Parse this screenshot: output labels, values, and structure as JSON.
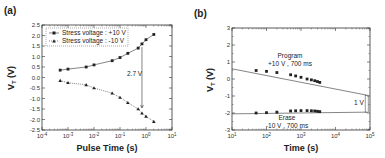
{
  "chart_data": [
    {
      "panel": "(a)",
      "type": "scatter",
      "title": "",
      "xlabel": "Pulse Time (s)",
      "ylabel": "V_T (V)",
      "xscale": "log",
      "xlim": [
        0.0001,
        10
      ],
      "ylim": [
        -2.5,
        2.5
      ],
      "xticks": [
        "10^-4",
        "10^-3",
        "10^-2",
        "10^-1",
        "10^0",
        "10^1"
      ],
      "yticks": [
        "2.5",
        "2.0",
        "1.5",
        "1.0",
        "0.5",
        "0.0",
        "-0.5",
        "-1.0",
        "-1.5",
        "-2.0",
        "-2.5"
      ],
      "grid": false,
      "legend_position": "upper left",
      "series": [
        {
          "name": "Stress voltage : +10 V",
          "marker": "square",
          "x": [
            0.0005,
            0.001,
            0.005,
            0.01,
            0.05,
            0.1,
            0.2,
            0.5,
            0.7,
            1.0,
            2.0
          ],
          "y": [
            0.35,
            0.4,
            0.5,
            0.6,
            0.8,
            0.95,
            1.15,
            1.4,
            1.6,
            1.8,
            2.05
          ]
        },
        {
          "name": "Stress voltage : -10 V",
          "marker": "triangle",
          "x": [
            0.0005,
            0.001,
            0.005,
            0.01,
            0.05,
            0.1,
            0.2,
            0.5,
            0.7,
            1.0,
            2.0
          ],
          "y": [
            -0.15,
            -0.25,
            -0.35,
            -0.5,
            -0.75,
            -0.95,
            -1.2,
            -1.5,
            -1.7,
            -1.85,
            -2.1
          ]
        }
      ],
      "annotations": [
        {
          "text": "2.7 V",
          "x": 0.7,
          "y_from": 1.45,
          "y_to": -1.45
        }
      ]
    },
    {
      "panel": "(b)",
      "type": "line",
      "title": "",
      "xlabel": "Time (s)",
      "ylabel": "V_T (V)",
      "xscale": "log",
      "xlim": [
        10,
        100000
      ],
      "ylim": [
        -3,
        3
      ],
      "xticks": [
        "10^1",
        "10^2",
        "10^3",
        "10^4",
        "10^5"
      ],
      "yticks": [
        "3",
        "2",
        "1",
        "0",
        "-1",
        "-2",
        "-3"
      ],
      "grid": false,
      "series": [
        {
          "name": "Program +10 V , 700 ms",
          "marker": "square",
          "x": [
            50,
            100,
            200,
            500,
            700,
            1000,
            1500,
            2000,
            2500,
            3000,
            3500
          ],
          "y": [
            0.5,
            0.45,
            0.38,
            0.25,
            0.18,
            0.1,
            0.0,
            -0.05,
            -0.1,
            -0.15,
            -0.2
          ],
          "extrapolation": {
            "x": [
              10,
              80000
            ],
            "y": [
              0.6,
              -0.95
            ]
          }
        },
        {
          "name": "Erase -10 V , 700 ms",
          "marker": "square",
          "x": [
            50,
            100,
            200,
            500,
            700,
            1000,
            1500,
            2000,
            2500,
            3000,
            3500
          ],
          "y": [
            -2.0,
            -1.98,
            -1.95,
            -1.88,
            -1.87,
            -1.86,
            -1.86,
            -1.87,
            -1.88,
            -1.9,
            -1.92
          ],
          "extrapolation": {
            "x": [
              10,
              80000
            ],
            "y": [
              -2.05,
              -1.95
            ]
          }
        }
      ],
      "annotations": [
        {
          "text": "Program",
          "sub": "+10 V , 700 ms"
        },
        {
          "text": "Erase",
          "sub": "-10 V , 700 ms"
        },
        {
          "text": "1 V",
          "x": 80000,
          "y_from": -0.95,
          "y_to": -1.95
        }
      ]
    }
  ],
  "labels": {
    "a_panel": "(a)",
    "b_panel": "(b)",
    "a_xlabel": "Pulse Time (s)",
    "b_xlabel": "Time (s)",
    "ylabel_main": "V",
    "ylabel_sub": "T",
    "ylabel_unit": " (V)",
    "a_legend_1": "Stress voltage : +10 V",
    "a_legend_2": "Stress voltage : -10 V",
    "a_annotation": "2.7 V",
    "b_program": "Program",
    "b_program_sub": "+10 V , 700 ms",
    "b_erase": "Erase",
    "b_erase_sub": "-10 V , 700 ms",
    "b_annotation": "1 V"
  }
}
